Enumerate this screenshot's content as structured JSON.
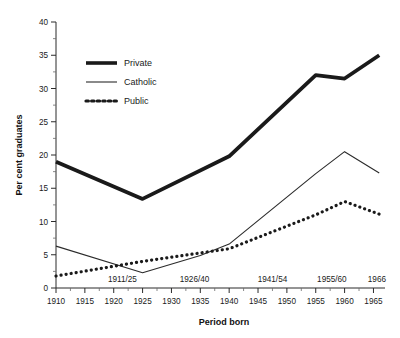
{
  "chart_data": {
    "type": "line",
    "title": "",
    "xlabel": "Period born",
    "ylabel": "Per cent graduates",
    "xlim": [
      1910,
      1967
    ],
    "ylim": [
      0,
      40
    ],
    "ytick_step": 5,
    "yticks": [
      0,
      5,
      10,
      15,
      20,
      25,
      30,
      35,
      40
    ],
    "xticks": [
      1910,
      1915,
      1920,
      1925,
      1930,
      1935,
      1940,
      1945,
      1950,
      1955,
      1960,
      1965
    ],
    "xtick_labels": [
      "1910",
      "1915",
      "1920",
      "1925",
      "1930",
      "1935",
      "1940",
      "1945",
      "1950",
      "1955",
      "1960",
      "1965"
    ],
    "ytick_labels": [
      "0",
      "5",
      "10",
      "15",
      "20",
      "25",
      "30",
      "35",
      "40"
    ],
    "minor_ticks": true,
    "grid": false,
    "legend_position": "upper-left-inside",
    "period_annotations": [
      {
        "label": "1911/25",
        "x": 1921.5
      },
      {
        "label": "1926/40",
        "x": 1934.0
      },
      {
        "label": "1941/54",
        "x": 1947.5
      },
      {
        "label": "1955/60",
        "x": 1957.8
      },
      {
        "label": "1966",
        "x": 1965.6
      }
    ],
    "x": [
      1910,
      1925,
      1940,
      1955,
      1960,
      1966
    ],
    "series": [
      {
        "name": "Private",
        "style": "thick-solid",
        "color": "#1a1a1a",
        "values": [
          19.0,
          13.4,
          19.8,
          32.0,
          31.5,
          35.0
        ]
      },
      {
        "name": "Catholic",
        "style": "thin-solid",
        "color": "#2b2b2b",
        "values": [
          6.3,
          2.3,
          6.6,
          17.2,
          20.5,
          17.3
        ]
      },
      {
        "name": "Public",
        "style": "dotted",
        "color": "#1a1a1a",
        "values": [
          1.8,
          4.0,
          5.9,
          11.0,
          13.0,
          11.1
        ]
      }
    ],
    "catholic_detail_x": [
      1910,
      1925,
      1935,
      1940,
      1955,
      1960,
      1966
    ],
    "catholic_detail_y": [
      6.3,
      2.3,
      4.9,
      6.6,
      17.2,
      20.5,
      17.3
    ]
  },
  "legend": {
    "items": [
      {
        "label": "Private",
        "marker": "thick-line"
      },
      {
        "label": "Catholic",
        "marker": "thin-line"
      },
      {
        "label": "Public",
        "marker": "dotted-line"
      }
    ]
  },
  "axes": {
    "y_title": "Per cent graduates",
    "x_title": "Period born"
  }
}
